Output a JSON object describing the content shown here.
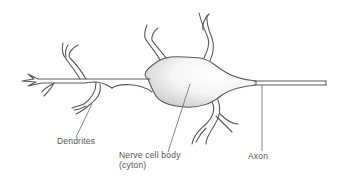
{
  "diagram": {
    "labels": {
      "dendrites": "Dendrites",
      "cell_body_line1": "Nerve cell body",
      "cell_body_line2": "(cyton)",
      "axon": "Axon"
    },
    "colors": {
      "outline": "#5a5a5a",
      "shading": "#d8d8d8",
      "text": "#555555",
      "background": "#ffffff"
    }
  }
}
